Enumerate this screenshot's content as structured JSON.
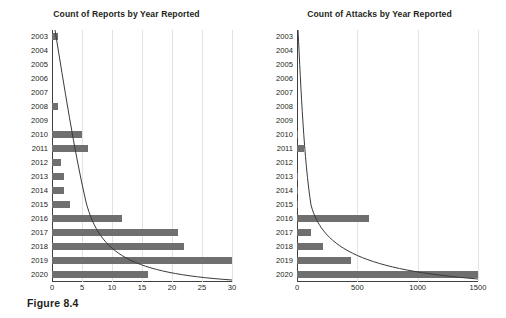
{
  "figure": {
    "caption": "Figure 8.4"
  },
  "colors": {
    "bar": "#6f6f6f",
    "trendline": "#3a3a3a",
    "gridline": "#e2e2e2",
    "axis": "#404040",
    "text": "#231f20",
    "background": "#ffffff"
  },
  "chart_data": [
    {
      "type": "bar",
      "id": "reports",
      "title": "Count of Reports by Year Reported",
      "xlabel": "",
      "ylabel": "",
      "orientation": "horizontal",
      "grid": true,
      "legend": false,
      "xlim": [
        0,
        30
      ],
      "xticks": [
        0,
        5,
        10,
        15,
        20,
        25,
        30
      ],
      "xtick_labels": [
        "0",
        "5",
        "10",
        "15",
        "20",
        "25",
        "30"
      ],
      "categories": [
        "2003",
        "2004",
        "2005",
        "2006",
        "2007",
        "2008",
        "2009",
        "2010",
        "2011",
        "2012",
        "2013",
        "2014",
        "2015",
        "2016",
        "2017",
        "2018",
        "2019",
        "2020"
      ],
      "values": [
        1,
        0,
        0,
        0,
        0,
        1,
        0,
        5,
        6,
        1.5,
        2,
        2,
        3,
        11.7,
        21,
        22,
        30,
        16
      ],
      "annotations": [
        "decreasing power-trend overlay line"
      ]
    },
    {
      "type": "bar",
      "id": "attacks",
      "title": "Count of Attacks by Year Reported",
      "xlabel": "",
      "ylabel": "",
      "orientation": "horizontal",
      "grid": true,
      "legend": false,
      "xlim": [
        0,
        1500
      ],
      "xticks": [
        0,
        500,
        1000,
        1500
      ],
      "xtick_labels": [
        "0",
        "500",
        "1000",
        "1500"
      ],
      "categories": [
        "2003",
        "2004",
        "2005",
        "2006",
        "2007",
        "2008",
        "2009",
        "2010",
        "2011",
        "2012",
        "2013",
        "2014",
        "2015",
        "2016",
        "2017",
        "2018",
        "2019",
        "2020"
      ],
      "values": [
        0,
        0,
        0,
        0,
        0,
        0,
        0,
        12,
        60,
        0,
        10,
        4,
        4,
        600,
        120,
        215,
        450,
        1500
      ],
      "annotations": [
        "decreasing power-trend overlay line"
      ]
    }
  ]
}
